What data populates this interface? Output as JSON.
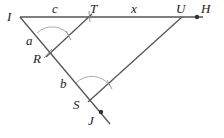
{
  "diagram": {
    "type": "geometry-similar-triangles",
    "points": {
      "I": {
        "label": "I",
        "x": 20,
        "y": 17
      },
      "T": {
        "label": "T",
        "x": 89,
        "y": 17
      },
      "U": {
        "label": "U",
        "x": 182,
        "y": 17
      },
      "H": {
        "label": "H",
        "x": 197,
        "y": 17
      },
      "R": {
        "label": "R",
        "x": 50,
        "y": 53
      },
      "S": {
        "label": "S",
        "x": 90,
        "y": 100
      },
      "J": {
        "label": "J",
        "x": 101,
        "y": 112
      }
    },
    "segment_labels": {
      "c": "c",
      "x": "x",
      "a": "a",
      "b": "b"
    },
    "colors": {
      "line": "#555555",
      "arc": "#aaaaaa",
      "text": "#222222"
    }
  }
}
